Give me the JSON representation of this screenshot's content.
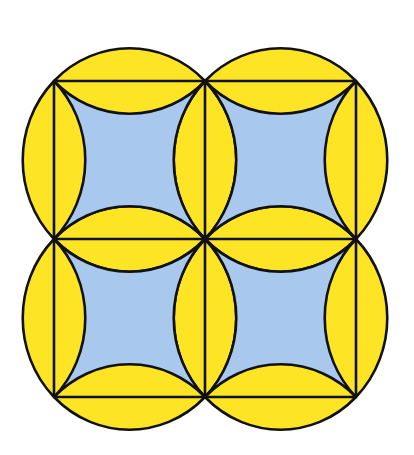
{
  "diagram": {
    "grid": {
      "rows": 2,
      "cols": 2,
      "origin_x": 54,
      "origin_y": 81,
      "cell_width": 151,
      "cell_height": 158
    },
    "colors": {
      "background": "#ffffff",
      "circle_fill": "#fde525",
      "inner_fill": "#a8c8ee",
      "stroke": "#111111"
    },
    "stroke_width": 2.6,
    "cells": [
      {
        "id": "top-left",
        "row": 0,
        "col": 0
      },
      {
        "id": "top-right",
        "row": 0,
        "col": 1
      },
      {
        "id": "bottom-left",
        "row": 1,
        "col": 0
      },
      {
        "id": "bottom-right",
        "row": 1,
        "col": 1
      }
    ]
  }
}
